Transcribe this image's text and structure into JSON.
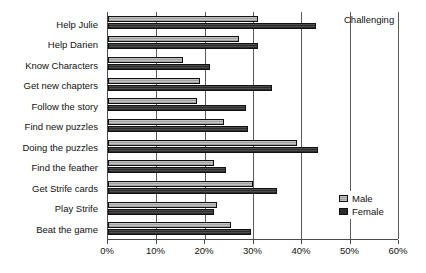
{
  "chart_data": {
    "type": "bar",
    "orientation": "horizontal",
    "title": "Challenging",
    "xlabel": "",
    "ylabel": "",
    "xlim": [
      0,
      60
    ],
    "xunit": "%",
    "xticks": [
      0,
      10,
      20,
      30,
      40,
      50,
      60
    ],
    "xtick_labels": [
      "0%",
      "10%",
      "20%",
      "30%",
      "40%",
      "50%",
      "60%"
    ],
    "grid": true,
    "legend_position": "right-bottom",
    "categories": [
      "Help Julie",
      "Help Darien",
      "Know Characters",
      "Get new chapters",
      "Follow the story",
      "Find new puzzles",
      "Doing the puzzles",
      "Find the feather",
      "Get Strife cards",
      "Play Strife",
      "Beat the game"
    ],
    "series": [
      {
        "name": "Male",
        "color": "#a9a9a9",
        "values": [
          31,
          27,
          15.5,
          19,
          18.5,
          24,
          39,
          22,
          30,
          22.5,
          25.5
        ]
      },
      {
        "name": "Female",
        "color": "#2b2b2b",
        "values": [
          43,
          31,
          21,
          34,
          28.5,
          29,
          43.5,
          24.5,
          35,
          22,
          29.5
        ]
      }
    ]
  },
  "legend": {
    "items": [
      {
        "label": "Male",
        "swatch": "male"
      },
      {
        "label": "Female",
        "swatch": "female"
      }
    ]
  }
}
